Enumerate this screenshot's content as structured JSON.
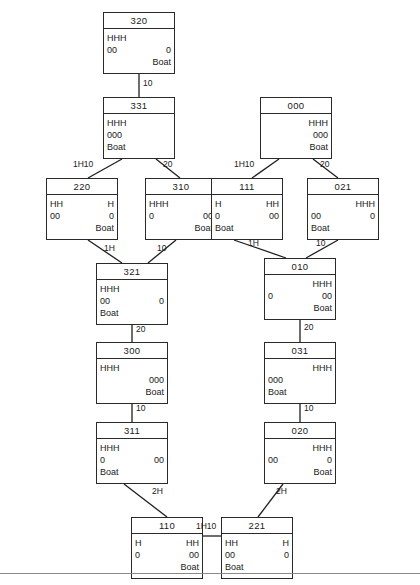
{
  "diagram": {
    "bottom_rule": true,
    "nodes": [
      {
        "id": "n320",
        "label": "320",
        "x": 103,
        "y": 12,
        "left": [
          "HHH",
          "00",
          ""
        ],
        "right": [
          "",
          "0",
          "Boat"
        ]
      },
      {
        "id": "n331",
        "label": "331",
        "x": 103,
        "y": 97,
        "left": [
          "HHH",
          "000",
          "Boat"
        ],
        "right": [
          "",
          "",
          ""
        ]
      },
      {
        "id": "n000",
        "label": "000",
        "x": 260,
        "y": 97,
        "left": [
          "",
          "",
          ""
        ],
        "right": [
          "HHH",
          "000",
          "Boat"
        ]
      },
      {
        "id": "n220",
        "label": "220",
        "x": 46,
        "y": 178,
        "left": [
          "HH",
          "00",
          ""
        ],
        "right": [
          "H",
          "0",
          "Boat"
        ]
      },
      {
        "id": "n310",
        "label": "310",
        "x": 145,
        "y": 178,
        "left": [
          "HHH",
          "0",
          ""
        ],
        "right": [
          "",
          "00",
          "Boat"
        ]
      },
      {
        "id": "n111",
        "label": "111",
        "x": 211,
        "y": 178,
        "left": [
          "H",
          "0",
          "Boat"
        ],
        "right": [
          "HH",
          "00",
          ""
        ]
      },
      {
        "id": "n021",
        "label": "021",
        "x": 307,
        "y": 178,
        "left": [
          "",
          "00",
          "Boat"
        ],
        "right": [
          "HHH",
          "0",
          ""
        ]
      },
      {
        "id": "n321",
        "label": "321",
        "x": 96,
        "y": 263,
        "left": [
          "HHH",
          "00",
          "Boat"
        ],
        "right": [
          "",
          "0",
          ""
        ]
      },
      {
        "id": "n010",
        "label": "010",
        "x": 264,
        "y": 258,
        "left": [
          "",
          "0",
          ""
        ],
        "right": [
          "HHH",
          "00",
          "Boat"
        ]
      },
      {
        "id": "n300",
        "label": "300",
        "x": 96,
        "y": 342,
        "left": [
          "HHH",
          "",
          ""
        ],
        "right": [
          "",
          "000",
          "Boat"
        ]
      },
      {
        "id": "n031",
        "label": "031",
        "x": 264,
        "y": 342,
        "left": [
          "",
          "000",
          "Boat"
        ],
        "right": [
          "HHH",
          "",
          ""
        ]
      },
      {
        "id": "n311",
        "label": "311",
        "x": 96,
        "y": 422,
        "left": [
          "HHH",
          "0",
          "Boat"
        ],
        "right": [
          "",
          "00",
          ""
        ]
      },
      {
        "id": "n020",
        "label": "020",
        "x": 264,
        "y": 422,
        "left": [
          "",
          "00",
          ""
        ],
        "right": [
          "HHH",
          "0",
          "Boat"
        ]
      },
      {
        "id": "n110",
        "label": "110",
        "x": 131,
        "y": 517,
        "left": [
          "H",
          "0",
          ""
        ],
        "right": [
          "HH",
          "00",
          "Boat"
        ]
      },
      {
        "id": "n221",
        "label": "221",
        "x": 221,
        "y": 517,
        "left": [
          "HH",
          "00",
          "Boat"
        ],
        "right": [
          "H",
          "0",
          ""
        ]
      }
    ],
    "edges": [
      {
        "id": "e1",
        "from": "n320",
        "to": "n331",
        "x1": 139,
        "y1": 74,
        "x2": 139,
        "y2": 97,
        "label": "10",
        "lx": 143,
        "ly": 78
      },
      {
        "id": "e2",
        "from": "n331",
        "to": "n220",
        "x1": 122,
        "y1": 159,
        "x2": 88,
        "y2": 178,
        "label": "1H10",
        "lx": 73,
        "ly": 159
      },
      {
        "id": "e3",
        "from": "n331",
        "to": "n310",
        "x1": 156,
        "y1": 159,
        "x2": 180,
        "y2": 178,
        "label": "20",
        "lx": 163,
        "ly": 159
      },
      {
        "id": "e4",
        "from": "n000",
        "to": "n111",
        "x1": 279,
        "y1": 159,
        "x2": 252,
        "y2": 178,
        "label": "1H10",
        "lx": 234,
        "ly": 159
      },
      {
        "id": "e5",
        "from": "n000",
        "to": "n021",
        "x1": 313,
        "y1": 159,
        "x2": 338,
        "y2": 178,
        "label": "20",
        "lx": 320,
        "ly": 159
      },
      {
        "id": "e6",
        "from": "n220",
        "to": "n321",
        "x1": 88,
        "y1": 240,
        "x2": 122,
        "y2": 263,
        "label": "1H",
        "lx": 104,
        "ly": 243
      },
      {
        "id": "e7",
        "from": "n310",
        "to": "n321",
        "x1": 176,
        "y1": 240,
        "x2": 148,
        "y2": 263,
        "label": "10",
        "lx": 157,
        "ly": 243
      },
      {
        "id": "e8",
        "from": "n111",
        "to": "n010",
        "x1": 234,
        "y1": 240,
        "x2": 286,
        "y2": 258,
        "label": "1H",
        "lx": 248,
        "ly": 238
      },
      {
        "id": "e9",
        "from": "n021",
        "to": "n010",
        "x1": 338,
        "y1": 240,
        "x2": 306,
        "y2": 258,
        "label": "10",
        "lx": 316,
        "ly": 238
      },
      {
        "id": "e10",
        "from": "n321",
        "to": "n300",
        "x1": 132,
        "y1": 325,
        "x2": 132,
        "y2": 342,
        "label": "20",
        "lx": 136,
        "ly": 324
      },
      {
        "id": "e11",
        "from": "n010",
        "to": "n031",
        "x1": 300,
        "y1": 320,
        "x2": 300,
        "y2": 342,
        "label": "20",
        "lx": 304,
        "ly": 322
      },
      {
        "id": "e12",
        "from": "n300",
        "to": "n311",
        "x1": 132,
        "y1": 404,
        "x2": 132,
        "y2": 422,
        "label": "10",
        "lx": 136,
        "ly": 403
      },
      {
        "id": "e13",
        "from": "n031",
        "to": "n020",
        "x1": 300,
        "y1": 404,
        "x2": 300,
        "y2": 422,
        "label": "10",
        "lx": 304,
        "ly": 403
      },
      {
        "id": "e14",
        "from": "n311",
        "to": "n110",
        "x1": 124,
        "y1": 484,
        "x2": 167,
        "y2": 517,
        "label": "2H",
        "lx": 152,
        "ly": 486
      },
      {
        "id": "e15",
        "from": "n020",
        "to": "n221",
        "x1": 283,
        "y1": 484,
        "x2": 258,
        "y2": 517,
        "label": "2H",
        "lx": 276,
        "ly": 486
      },
      {
        "id": "e16",
        "from": "n110",
        "to": "n221",
        "x1": 203,
        "y1": 536,
        "x2": 221,
        "y2": 536,
        "label": "1H10",
        "lx": 196,
        "ly": 521
      }
    ]
  }
}
